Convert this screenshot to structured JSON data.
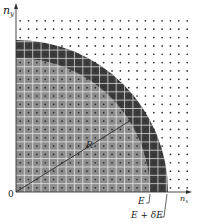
{
  "diagram": {
    "axes": {
      "y_label_main": "n",
      "y_label_sub": "y",
      "x_label_main": "n",
      "x_label_sub": "x",
      "origin_label": "0"
    },
    "labels": {
      "radius": "R",
      "inner_energy": "E",
      "outer_energy": "E + δE"
    },
    "geometry": {
      "origin_x": 16,
      "origin_y": 192,
      "grid_step": 8.35,
      "inner_radius": 134,
      "outer_radius": 152,
      "lattice_cols": 21,
      "lattice_rows": 22
    },
    "colors": {
      "inner_fill": "#8e8e8e",
      "shell_fill": "#3c3c3c",
      "grid_line": "#ffffff",
      "dot": "#2a2a2a",
      "axis": "#333333"
    }
  }
}
